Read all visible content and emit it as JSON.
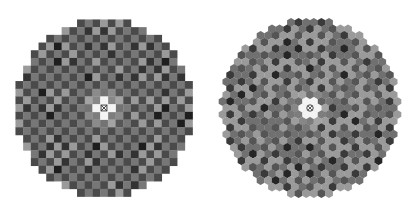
{
  "figures": [
    {
      "id": "square-grid-map",
      "type": "square",
      "center": [
        104,
        108
      ],
      "radius_cells": 11.6,
      "cell_size": 7.7,
      "marker": "crossed-box-marker",
      "center_color": "#f4f4f4",
      "palette": {
        "background": "#777777",
        "light": "#9a9a9a",
        "dark": "#4a4a4a",
        "darker": "#333333",
        "darkest": "#1e1e1e",
        "glow": "#b8b8b8"
      }
    },
    {
      "id": "hex-grid-map",
      "type": "hex",
      "center": [
        104,
        108
      ],
      "radius_cells": 11.6,
      "cell_size": 7.6,
      "marker": "circled-cross-marker",
      "center_color": "#f4f4f4",
      "palette": {
        "background": "#707070",
        "light": "#9a9a9a",
        "dark": "#555555",
        "darker": "#3a3a3a",
        "darkest": "#262626",
        "glow": "#b4b4b4"
      }
    }
  ]
}
